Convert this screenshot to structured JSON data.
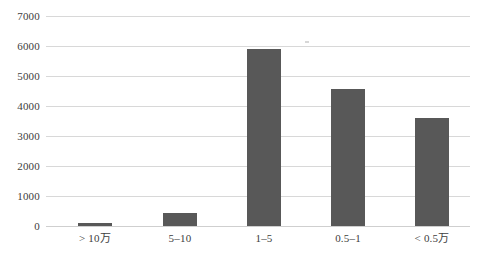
{
  "chart_data": {
    "type": "bar",
    "title": "",
    "subtitle": "",
    "xlabel": "",
    "ylabel": "",
    "categories": [
      "> 10万",
      "5–10",
      "1–5",
      "0.5–1",
      "< 0.5万"
    ],
    "values": [
      100,
      440,
      5900,
      4570,
      3600
    ],
    "series": [
      {
        "name": "",
        "values": [
          100,
          440,
          5900,
          4570,
          3600
        ]
      }
    ],
    "ylim": [
      0,
      7000
    ],
    "ytick_values": [
      0,
      1000,
      2000,
      3000,
      4000,
      5000,
      6000,
      7000
    ],
    "ytick_labels": [
      "0",
      "1000",
      "2000",
      "3000",
      "4000",
      "5000",
      "6000",
      "7000"
    ],
    "grid": true,
    "grid_axis": "y",
    "legend": false,
    "legend_position": "none",
    "bar_color": "#585858",
    "gridline_color": "#d8d8d8",
    "background_color": "#ffffff",
    "text_color": "#404040"
  }
}
